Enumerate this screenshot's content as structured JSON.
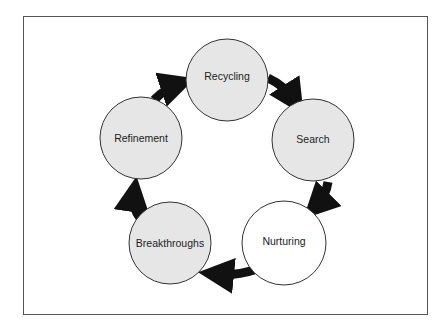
{
  "diagram": {
    "type": "cycle",
    "colors": {
      "gray_fill": "#e6e6e6",
      "white_fill": "#ffffff",
      "arrow": "#111111",
      "outline": "#333333"
    },
    "nodes": [
      {
        "label": "Recycling",
        "fill": "gray"
      },
      {
        "label": "Search",
        "fill": "gray"
      },
      {
        "label": "Nurturing",
        "fill": "white"
      },
      {
        "label": "Breakthroughs",
        "fill": "gray"
      },
      {
        "label": "Refinement",
        "fill": "gray"
      }
    ],
    "edges": [
      {
        "from": "Recycling",
        "to": "Search"
      },
      {
        "from": "Search",
        "to": "Nurturing"
      },
      {
        "from": "Nurturing",
        "to": "Breakthroughs"
      },
      {
        "from": "Breakthroughs",
        "to": "Refinement"
      },
      {
        "from": "Refinement",
        "to": "Recycling"
      }
    ]
  }
}
